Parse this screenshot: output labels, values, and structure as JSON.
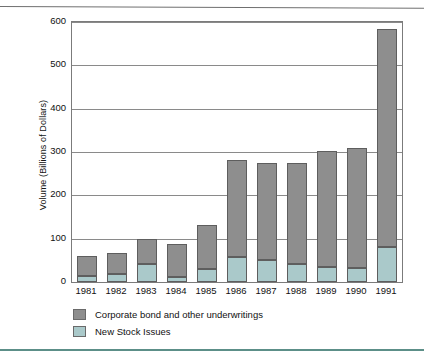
{
  "chart_data": {
    "type": "bar",
    "subtype": "stacked",
    "title": "",
    "xlabel": "",
    "ylabel": "Volume (Billions of Dollars)",
    "categories": [
      "1981",
      "1982",
      "1983",
      "1984",
      "1985",
      "1986",
      "1987",
      "1988",
      "1989",
      "1990",
      "1991"
    ],
    "series": [
      {
        "name": "New Stock Issues",
        "color": "#aac9ca",
        "values": [
          14,
          18,
          42,
          12,
          30,
          58,
          50,
          41,
          35,
          32,
          81
        ]
      },
      {
        "name": "Corporate bond and other underwritings",
        "color": "#8e8e8e",
        "values": [
          46,
          48,
          57,
          76,
          102,
          224,
          225,
          234,
          267,
          277,
          503
        ]
      }
    ],
    "totals": [
      60,
      66,
      99,
      88,
      132,
      282,
      275,
      275,
      302,
      309,
      584
    ],
    "ylim": [
      0,
      600
    ],
    "yticks": [
      0,
      100,
      200,
      300,
      400,
      500,
      600
    ],
    "ytick_labels": [
      "0",
      "100",
      "200",
      "300",
      "400",
      "500",
      "600"
    ],
    "grid": true,
    "legend_position": "below-axis-left",
    "legend": [
      {
        "label": "Corporate bond and other underwritings",
        "color": "#8e8e8e"
      },
      {
        "label": "New Stock Issues",
        "color": "#aac9ca"
      }
    ]
  },
  "figure": {
    "axis_frame_color": "#7b7b7b",
    "gridline_color": "#8a8a8a",
    "bar_outline_color": "#5e5e5e",
    "rule_top_color": "#6f6f6f",
    "rule_bottom_color": "#5c8f88",
    "background": "#ffffff"
  }
}
